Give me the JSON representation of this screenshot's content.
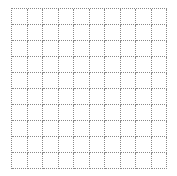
{
  "board": {
    "rows": 10,
    "columns": 10,
    "line_color": "#8a8a8a",
    "line_style": "dotted",
    "background_color": "#ffffff",
    "cells_filled": 0
  }
}
